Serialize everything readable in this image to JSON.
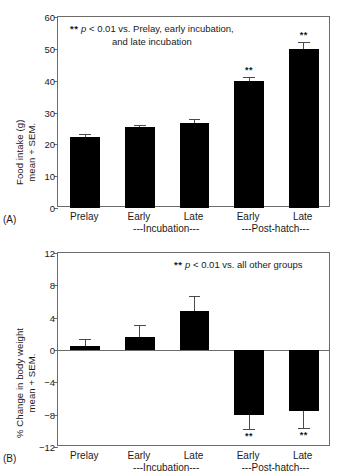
{
  "figure": {
    "panel_a_label": "(A)",
    "panel_b_label": "(B)"
  },
  "chart_data": [
    {
      "type": "bar",
      "panel": "(A)",
      "title": "",
      "xlabel": "",
      "ylabel": "Food intake (g) mean + SEM.",
      "ylabel_line1": "Food intake (g)",
      "ylabel_line2": "mean + SEM.",
      "ylim": [
        0,
        60
      ],
      "yticks": [
        0,
        10,
        20,
        30,
        40,
        50,
        60
      ],
      "ytick_labels": [
        "0",
        "10",
        "20",
        "30",
        "40",
        "50",
        "60"
      ],
      "grid": false,
      "legend": "none",
      "categories": [
        "Prelay",
        "Early",
        "Late",
        "Early",
        "Late"
      ],
      "group_labels": [
        "---Incubation---",
        "---Post-hatch---"
      ],
      "values": [
        22.4,
        25.3,
        26.8,
        39.8,
        50.1
      ],
      "errors": [
        0.7,
        0.8,
        1.1,
        1.3,
        2.2
      ],
      "significance": [
        "",
        "",
        "",
        "**",
        "**"
      ],
      "annotation_line1_prefix": "**",
      "annotation_line1_italic": "p",
      "annotation_line1_rest": " < 0.01 vs. Prelay, early incubation,",
      "annotation_line2": "and late incubation",
      "bar_color": "#000000"
    },
    {
      "type": "bar",
      "panel": "(B)",
      "title": "",
      "xlabel": "",
      "ylabel": "% Change in body weight mean + SEM.",
      "ylabel_line1": "% Change in body weight",
      "ylabel_line2": "mean + SEM.",
      "ylim": [
        -12,
        12
      ],
      "yticks": [
        -12,
        -8,
        -4,
        0,
        4,
        8,
        12
      ],
      "ytick_labels": [
        "−12",
        "−8",
        "−4",
        "0",
        "4",
        "8",
        "12"
      ],
      "grid": false,
      "legend": "none",
      "categories": [
        "Prelay",
        "Early",
        "Late",
        "Early",
        "Late"
      ],
      "group_labels": [
        "---Incubation---",
        "---Post-hatch---"
      ],
      "values": [
        0.5,
        1.6,
        4.8,
        -8.1,
        -7.5
      ],
      "errors": [
        0.8,
        1.5,
        1.9,
        1.7,
        2.1
      ],
      "significance": [
        "",
        "",
        "",
        "**",
        "**"
      ],
      "annotation_line1_prefix": "**",
      "annotation_line1_italic": "p",
      "annotation_line1_rest": " < 0.01 vs. all other groups",
      "annotation_line2": "",
      "bar_color": "#000000"
    }
  ]
}
